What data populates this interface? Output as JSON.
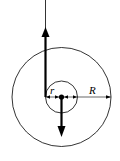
{
  "diagram": {
    "labels": {
      "inner_radius": "r",
      "outer_radius": "R"
    },
    "elements": {
      "outer_circle": "outer circle of radius R",
      "inner_circle": "inner circle of radius r",
      "center_dot": "pivot point",
      "up_force": "upward force arrow at left edge of inner radius",
      "down_force": "downward force arrow at center"
    }
  }
}
